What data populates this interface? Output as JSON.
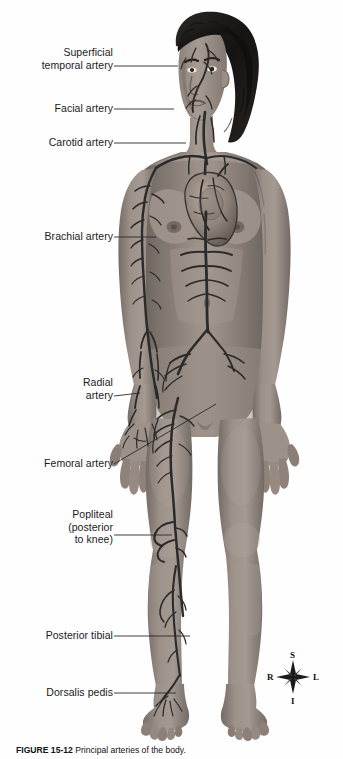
{
  "figure": {
    "caption_prefix": "FIGURE 15-12",
    "caption_text": "Principal arteries of the body.",
    "background_color": "#ffffff",
    "skin_color": "#9a8f87",
    "artery_color": "#2b2b2b",
    "hair_color": "#1c1a1a",
    "leader_color": "#2a2a2a",
    "text_color": "#1a1a1a"
  },
  "labels": [
    {
      "id": "superficial-temporal-artery",
      "text": "Superficial\ntemporal artery",
      "x": 18,
      "y": 46,
      "width": 95,
      "leader": {
        "x1": 114,
        "y1": 66,
        "x2": 178,
        "y2": 66
      }
    },
    {
      "id": "facial-artery",
      "text": "Facial artery",
      "x": 38,
      "y": 102,
      "width": 75,
      "leader": {
        "x1": 114,
        "y1": 109,
        "x2": 174,
        "y2": 109
      }
    },
    {
      "id": "carotid-artery",
      "text": "Carotid artery",
      "x": 33,
      "y": 136,
      "width": 80,
      "leader": {
        "x1": 114,
        "y1": 143,
        "x2": 186,
        "y2": 143
      }
    },
    {
      "id": "brachial-artery",
      "text": "Brachial artery",
      "x": 28,
      "y": 230,
      "width": 85,
      "leader": {
        "x1": 114,
        "y1": 237,
        "x2": 156,
        "y2": 237
      }
    },
    {
      "id": "radial-artery",
      "text": "Radial\nartery",
      "x": 43,
      "y": 376,
      "width": 70,
      "leader": {
        "x1": 114,
        "y1": 396,
        "x2": 140,
        "y2": 393
      }
    },
    {
      "id": "femoral-artery",
      "text": "Femoral artery",
      "x": 28,
      "y": 457,
      "width": 85,
      "leader": {
        "x1": 114,
        "y1": 464,
        "x2": 216,
        "y2": 404
      }
    },
    {
      "id": "popliteal-artery",
      "text": "Popliteal\n(posterior\nto knee)",
      "x": 33,
      "y": 508,
      "width": 80,
      "leader": {
        "x1": 114,
        "y1": 535,
        "x2": 172,
        "y2": 535
      }
    },
    {
      "id": "posterior-tibial-artery",
      "text": "Posterior tibial",
      "x": 28,
      "y": 629,
      "width": 85,
      "leader": {
        "x1": 114,
        "y1": 636,
        "x2": 190,
        "y2": 636
      }
    },
    {
      "id": "dorsalis-pedis-artery",
      "text": "Dorsalis pedis",
      "x": 30,
      "y": 686,
      "width": 83,
      "leader": {
        "x1": 114,
        "y1": 693,
        "x2": 176,
        "y2": 693
      }
    }
  ],
  "compass": {
    "center_x": 293,
    "center_y": 677,
    "superior": "S",
    "inferior": "I",
    "right": "R",
    "left": "L"
  }
}
